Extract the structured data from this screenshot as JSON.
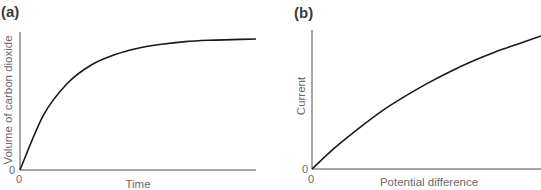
{
  "panels": {
    "a": {
      "label": "(a)"
    },
    "b": {
      "label": "(b)"
    }
  },
  "chart_data": [
    {
      "type": "line",
      "panel": "(a)",
      "title": "",
      "xlabel": "Time",
      "ylabel": "Volume of carbon dioxide",
      "x_tick_labels": [
        "0"
      ],
      "y_tick_labels": [
        "0"
      ],
      "grid": false,
      "legend": null,
      "description": "Curve rises steeply from origin then levels off (plateaus) — exponential approach to maximum",
      "x": [
        0,
        0.1,
        0.2,
        0.3,
        0.4,
        0.5,
        0.6,
        0.7,
        0.8,
        0.9,
        1.0
      ],
      "values": [
        0,
        0.42,
        0.66,
        0.8,
        0.88,
        0.93,
        0.96,
        0.98,
        0.99,
        0.995,
        1.0
      ]
    },
    {
      "type": "line",
      "panel": "(b)",
      "title": "",
      "xlabel": "Potential difference",
      "ylabel": "Current",
      "x_tick_labels": [
        "0"
      ],
      "y_tick_labels": [
        "0"
      ],
      "grid": false,
      "legend": null,
      "description": "Current increases with potential difference with gradually decreasing gradient",
      "x": [
        0,
        0.1,
        0.2,
        0.3,
        0.4,
        0.5,
        0.6,
        0.7,
        0.8,
        0.9,
        1.0
      ],
      "values": [
        0,
        0.16,
        0.3,
        0.43,
        0.54,
        0.64,
        0.73,
        0.81,
        0.88,
        0.94,
        1.0
      ]
    }
  ]
}
